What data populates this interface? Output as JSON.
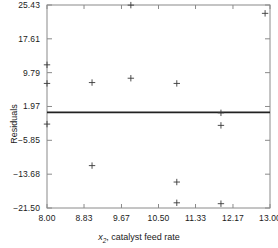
{
  "chart_data": {
    "type": "scatter",
    "title": "",
    "xlabel": "x2, catalyst feed rate",
    "xlabel_var": "x",
    "xlabel_sub": "2",
    "xlabel_rest": ", catalyst feed rate",
    "ylabel": "Residuals",
    "xlim": [
      8.0,
      13.0
    ],
    "ylim": [
      -21.5,
      25.43
    ],
    "xticks": [
      8.0,
      8.83,
      9.67,
      10.5,
      11.33,
      12.17,
      13.0
    ],
    "xtick_labels": [
      "8.00",
      "8.83",
      "9.67",
      "10.50",
      "11.33",
      "12.17",
      "13.00"
    ],
    "yticks": [
      -21.5,
      -13.68,
      -5.85,
      1.97,
      9.79,
      17.61,
      25.43
    ],
    "ytick_labels": [
      "−21.50",
      "−13.68",
      "−5.85",
      "1.97",
      "9.79",
      "17.61",
      "25.43"
    ],
    "grid": false,
    "legend": null,
    "marker": "plus",
    "marker_color": "#3a3a3a",
    "frame_color": "#8a8a8a",
    "reference_line": {
      "orientation": "horizontal",
      "y": 0.6,
      "color": "#222222",
      "width": 1.6
    },
    "points": [
      {
        "x": 8.0,
        "y": 11.6
      },
      {
        "x": 8.0,
        "y": 7.3
      },
      {
        "x": 8.0,
        "y": -2.1
      },
      {
        "x": 9.01,
        "y": 7.5
      },
      {
        "x": 9.01,
        "y": -11.7
      },
      {
        "x": 9.88,
        "y": 25.4
      },
      {
        "x": 9.88,
        "y": 8.5
      },
      {
        "x": 10.91,
        "y": 7.3
      },
      {
        "x": 10.91,
        "y": -15.5
      },
      {
        "x": 10.91,
        "y": -20.3
      },
      {
        "x": 11.9,
        "y": 0.5
      },
      {
        "x": 11.9,
        "y": -2.4
      },
      {
        "x": 11.9,
        "y": -20.5
      },
      {
        "x": 12.89,
        "y": 23.5
      }
    ]
  }
}
